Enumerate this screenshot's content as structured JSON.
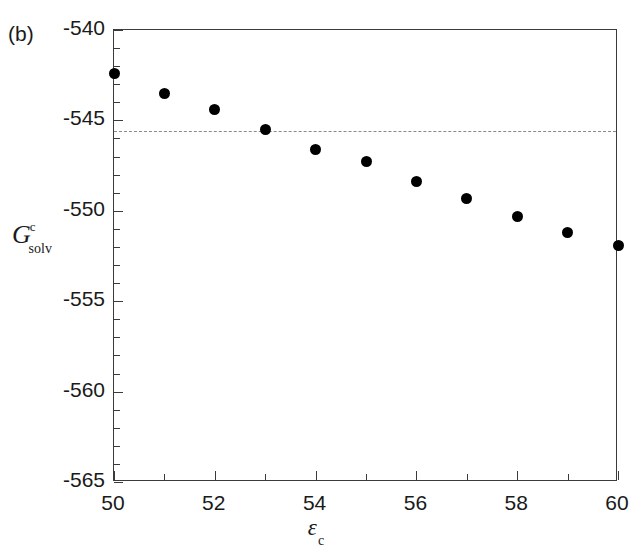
{
  "figure": {
    "panel_label": "(b)",
    "background_color": "#ffffff",
    "axis_color": "#3b3b3b",
    "marker_color": "#000000",
    "reference_line_color": "#8a8a8a"
  },
  "axes": {
    "y_title_base": "G",
    "y_title_superscript": "c",
    "y_title_subscript": "solv",
    "x_title_base": "ε",
    "x_title_subscript": "c"
  },
  "chart_data": {
    "type": "scatter",
    "title": "(b)",
    "xlabel": "ε c",
    "ylabel": "G c solv",
    "xlim": [
      50,
      60
    ],
    "ylim": [
      -565,
      -540
    ],
    "xticks": [
      50,
      52,
      54,
      56,
      58,
      60
    ],
    "xtick_labels": [
      "50",
      "52",
      "54",
      "56",
      "58",
      "60"
    ],
    "x_minor_ticks": [
      51,
      53,
      55,
      57,
      59
    ],
    "yticks": [
      -540,
      -545,
      -550,
      -555,
      -560,
      -565
    ],
    "ytick_labels": [
      "-540",
      "-545",
      "-550",
      "-555",
      "-560",
      "-565"
    ],
    "y_minor_ticks": [
      -541,
      -542,
      -543,
      -544,
      -546,
      -547,
      -548,
      -549,
      -551,
      -552,
      -553,
      -554,
      -556,
      -557,
      -558,
      -559,
      -561,
      -562,
      -563,
      -564
    ],
    "grid": false,
    "legend": null,
    "x": [
      50,
      51,
      52,
      53,
      54,
      55,
      56,
      57,
      58,
      59,
      60
    ],
    "y": [
      -542.4,
      -543.5,
      -544.4,
      -545.5,
      -546.6,
      -547.3,
      -548.4,
      -549.3,
      -550.3,
      -551.2,
      -551.9
    ],
    "series": [
      {
        "name": "Gsolv_c",
        "marker": "filled-circle",
        "values": [
          -542.4,
          -543.5,
          -544.4,
          -545.5,
          -546.6,
          -547.3,
          -548.4,
          -549.3,
          -550.3,
          -551.2,
          -551.9
        ]
      }
    ],
    "annotations": [
      {
        "type": "horizontal-dashed-line",
        "y": -545.6,
        "style": "dashed",
        "color": "#8a8a8a"
      }
    ]
  }
}
